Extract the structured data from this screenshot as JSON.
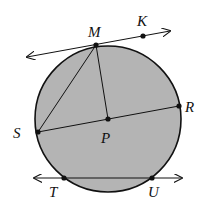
{
  "diagram": {
    "title": "",
    "colors": {
      "circle_fill": "#b4b4b4",
      "stroke": "#111111",
      "background": "#ffffff"
    },
    "circle": {
      "center_label": "P",
      "cx": 108,
      "cy": 119,
      "r": 73
    },
    "points": [
      {
        "id": "M",
        "label": "M",
        "x": 96,
        "y": 45,
        "lx": 88,
        "ly": 33
      },
      {
        "id": "K",
        "label": "K",
        "x": 143,
        "y": 36,
        "lx": 137,
        "ly": 24
      },
      {
        "id": "R",
        "label": "R",
        "x": 179,
        "y": 106,
        "lx": 186,
        "ly": 112
      },
      {
        "id": "S",
        "label": "S",
        "x": 38,
        "y": 132,
        "lx": 13,
        "ly": 138
      },
      {
        "id": "P",
        "label": "P",
        "x": 108,
        "y": 119,
        "lx": 101,
        "ly": 143
      },
      {
        "id": "T",
        "label": "T",
        "x": 64,
        "y": 178,
        "lx": 48,
        "ly": 198
      },
      {
        "id": "U",
        "label": "U",
        "x": 152,
        "y": 178,
        "lx": 148,
        "ly": 198
      }
    ],
    "lines": [
      {
        "name": "tangent-line-MK",
        "type": "line",
        "through": [
          "M",
          "K"
        ]
      },
      {
        "name": "secant-line-TU",
        "type": "line",
        "through": [
          "T",
          "U"
        ]
      }
    ],
    "segments": [
      {
        "name": "chord-MS",
        "from": "M",
        "to": "S"
      },
      {
        "name": "radius-MP",
        "from": "M",
        "to": "P"
      },
      {
        "name": "diameter-SR",
        "from": "S",
        "to": "R"
      }
    ]
  }
}
